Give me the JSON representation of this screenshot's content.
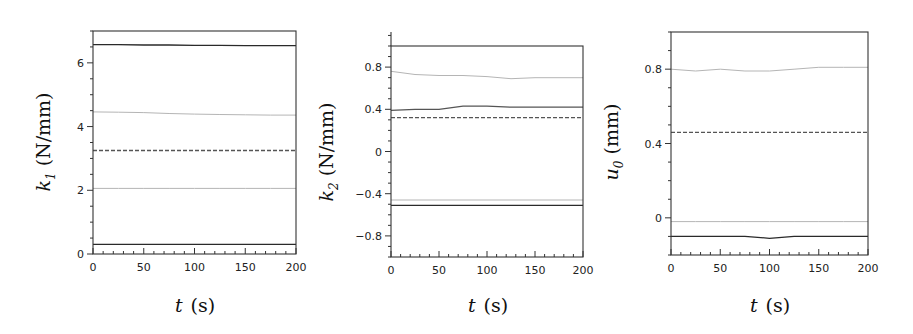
{
  "figure": {
    "panels": [
      {
        "id": "k1",
        "ylabel_symbol": "k",
        "ylabel_sub": "1",
        "ylabel_unit": "(N/mm)",
        "xlabel_symbol": "t",
        "xlabel_unit": "(s)"
      },
      {
        "id": "k2",
        "ylabel_symbol": "k",
        "ylabel_sub": "2",
        "ylabel_unit": "(N/mm)",
        "xlabel_symbol": "t",
        "xlabel_unit": "(s)"
      },
      {
        "id": "u0",
        "ylabel_symbol": "u",
        "ylabel_sub": "0",
        "ylabel_unit": "(mm)",
        "xlabel_symbol": "t",
        "xlabel_unit": "(s)"
      }
    ]
  },
  "colors": {
    "black": "#2a2a2a",
    "dark_gray": "#555555",
    "light_gray": "#b5b5b5",
    "dashed": "#555555",
    "frame": "#333333"
  },
  "chart_data": [
    {
      "type": "line",
      "title": "",
      "xlabel": "t (s)",
      "ylabel": "k1 (N/mm)",
      "xlim": [
        0,
        200
      ],
      "ylim": [
        0,
        7
      ],
      "xticks": [
        0,
        50,
        100,
        150,
        200
      ],
      "yticks": [
        0,
        2,
        4,
        6
      ],
      "grid": false,
      "legend": null,
      "x": [
        0,
        25,
        50,
        75,
        100,
        125,
        150,
        175,
        200
      ],
      "series": [
        {
          "name": "black upper",
          "style": "solid",
          "color": "black",
          "values": [
            6.57,
            6.57,
            6.56,
            6.56,
            6.55,
            6.55,
            6.54,
            6.54,
            6.54
          ]
        },
        {
          "name": "gray upper",
          "style": "solid",
          "color": "light_gray",
          "values": [
            4.46,
            4.45,
            4.44,
            4.41,
            4.39,
            4.38,
            4.37,
            4.36,
            4.36
          ]
        },
        {
          "name": "mean",
          "style": "dashed",
          "color": "dashed",
          "values": [
            3.25,
            3.25,
            3.25,
            3.25,
            3.25,
            3.25,
            3.25,
            3.25,
            3.25
          ]
        },
        {
          "name": "gray lower",
          "style": "solid",
          "color": "light_gray",
          "values": [
            2.06,
            2.06,
            2.06,
            2.06,
            2.06,
            2.06,
            2.06,
            2.06,
            2.06
          ]
        },
        {
          "name": "black lower",
          "style": "solid",
          "color": "black",
          "values": [
            0.3,
            0.3,
            0.3,
            0.3,
            0.3,
            0.3,
            0.3,
            0.3,
            0.3
          ]
        }
      ]
    },
    {
      "type": "line",
      "title": "",
      "xlabel": "t (s)",
      "ylabel": "k2 (N/mm)",
      "xlim": [
        0,
        200
      ],
      "ylim": [
        -1,
        1
      ],
      "xticks": [
        0,
        50,
        100,
        150,
        200
      ],
      "yticks": [
        -0.8,
        -0.4,
        0,
        0.4,
        0.8
      ],
      "grid": false,
      "legend": null,
      "x": [
        0,
        25,
        50,
        75,
        100,
        125,
        150,
        175,
        200
      ],
      "series": [
        {
          "name": "gray upper",
          "style": "solid",
          "color": "light_gray",
          "values": [
            0.76,
            0.73,
            0.72,
            0.72,
            0.71,
            0.69,
            0.7,
            0.7,
            0.7
          ]
        },
        {
          "name": "dark upper",
          "style": "solid",
          "color": "dark_gray",
          "values": [
            0.39,
            0.4,
            0.4,
            0.43,
            0.43,
            0.42,
            0.42,
            0.42,
            0.42
          ]
        },
        {
          "name": "mean",
          "style": "dashed",
          "color": "dashed",
          "values": [
            0.32,
            0.32,
            0.32,
            0.32,
            0.32,
            0.32,
            0.32,
            0.32,
            0.32
          ]
        },
        {
          "name": "gray lower",
          "style": "solid",
          "color": "light_gray",
          "values": [
            -0.46,
            -0.46,
            -0.46,
            -0.46,
            -0.46,
            -0.46,
            -0.46,
            -0.46,
            -0.46
          ]
        },
        {
          "name": "black lower",
          "style": "solid",
          "color": "black",
          "values": [
            -0.51,
            -0.51,
            -0.51,
            -0.51,
            -0.51,
            -0.51,
            -0.51,
            -0.51,
            -0.51
          ]
        }
      ]
    },
    {
      "type": "line",
      "title": "",
      "xlabel": "t (s)",
      "ylabel": "u0 (mm)",
      "xlim": [
        0,
        200
      ],
      "ylim": [
        -0.2,
        1.0
      ],
      "xticks": [
        0,
        50,
        100,
        150,
        200
      ],
      "yticks": [
        0,
        0.4,
        0.8
      ],
      "grid": false,
      "legend": null,
      "x": [
        0,
        25,
        50,
        75,
        100,
        125,
        150,
        175,
        200
      ],
      "series": [
        {
          "name": "gray upper",
          "style": "solid",
          "color": "light_gray",
          "values": [
            0.8,
            0.79,
            0.8,
            0.79,
            0.79,
            0.8,
            0.81,
            0.81,
            0.81
          ]
        },
        {
          "name": "mean",
          "style": "dashed",
          "color": "dashed",
          "values": [
            0.46,
            0.46,
            0.46,
            0.46,
            0.46,
            0.46,
            0.46,
            0.46,
            0.46
          ]
        },
        {
          "name": "gray lower",
          "style": "solid",
          "color": "light_gray",
          "values": [
            -0.02,
            -0.02,
            -0.02,
            -0.02,
            -0.02,
            -0.02,
            -0.02,
            -0.02,
            -0.02
          ]
        },
        {
          "name": "black lower",
          "style": "solid",
          "color": "black",
          "values": [
            -0.1,
            -0.1,
            -0.1,
            -0.1,
            -0.11,
            -0.1,
            -0.1,
            -0.1,
            -0.1
          ]
        }
      ]
    }
  ]
}
